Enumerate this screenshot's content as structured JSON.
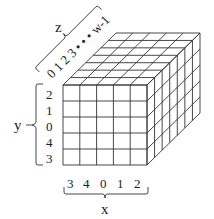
{
  "diagram": {
    "x_axis": {
      "label": "x",
      "ticks": [
        "3",
        "4",
        "0",
        "1",
        "2"
      ]
    },
    "y_axis": {
      "label": "y",
      "ticks": [
        "2",
        "1",
        "0",
        "4",
        "3"
      ]
    },
    "z_axis": {
      "label": "z",
      "ticks_text": "0 1 2 3 • • • w-1"
    },
    "grid": {
      "front_columns": 5,
      "front_rows": 5,
      "depth_divisions": 7
    },
    "colors": {
      "line": "#333333",
      "background": "#ffffff"
    }
  }
}
